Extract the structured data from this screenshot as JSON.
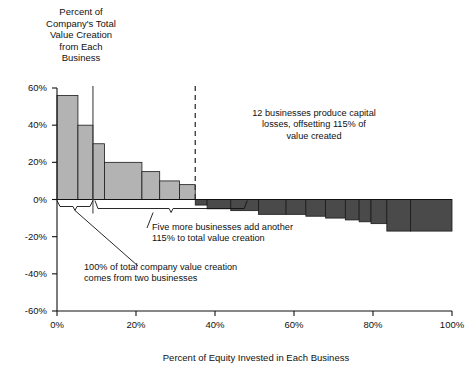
{
  "chart_data": {
    "type": "bar",
    "title": "",
    "ylabel": "Percent of\nCompany's Total\nValue Creation\nfrom Each\nBusiness",
    "xlabel": "Percent of Equity Invested in Each Business",
    "ylim": [
      -60,
      60
    ],
    "xlim": [
      0,
      100
    ],
    "grid": false,
    "legend": "none",
    "y_ticks": [
      "60%",
      "40%",
      "20%",
      "0%",
      "-20%",
      "-40%",
      "-60%"
    ],
    "y_tick_values": [
      60,
      40,
      20,
      0,
      -20,
      -40,
      -60
    ],
    "x_ticks": [
      "0%",
      "20%",
      "40%",
      "60%",
      "80%",
      "100%"
    ],
    "x_tick_values": [
      0,
      20,
      40,
      60,
      80,
      100
    ],
    "bar_fill_positive": "#b3b3b3",
    "bar_fill_negative": "#4a4a4a",
    "bars": [
      {
        "x0": 0.0,
        "x1": 5.3,
        "value": 56
      },
      {
        "x0": 5.3,
        "x1": 9.1,
        "value": 40
      },
      {
        "x0": 9.1,
        "x1": 12.0,
        "value": 30
      },
      {
        "x0": 12.0,
        "x1": 21.5,
        "value": 20
      },
      {
        "x0": 21.5,
        "x1": 26.0,
        "value": 15
      },
      {
        "x0": 26.0,
        "x1": 31.0,
        "value": 10
      },
      {
        "x0": 31.0,
        "x1": 35.0,
        "value": 8
      },
      {
        "x0": 35.0,
        "x1": 38.0,
        "value": -3
      },
      {
        "x0": 38.0,
        "x1": 44.0,
        "value": -5
      },
      {
        "x0": 44.0,
        "x1": 51.0,
        "value": -6
      },
      {
        "x0": 51.0,
        "x1": 58.0,
        "value": -8
      },
      {
        "x0": 58.0,
        "x1": 63.0,
        "value": -8
      },
      {
        "x0": 63.0,
        "x1": 68.0,
        "value": -9
      },
      {
        "x0": 68.0,
        "x1": 73.0,
        "value": -10
      },
      {
        "x0": 73.0,
        "x1": 76.5,
        "value": -11
      },
      {
        "x0": 76.5,
        "x1": 79.5,
        "value": -12
      },
      {
        "x0": 79.5,
        "x1": 83.5,
        "value": -13
      },
      {
        "x0": 83.5,
        "x1": 89.5,
        "value": -17
      },
      {
        "x0": 89.5,
        "x1": 100.0,
        "value": -17
      }
    ],
    "markers": {
      "solid_vline_x": 9.1,
      "dashed_vline_x": 35.0
    },
    "annotations": [
      {
        "id": "capital-losses",
        "text": "12 businesses produce capital\nlosses, offsetting 115% of\nvalue created",
        "x_pct": 62,
        "y_pct": 34
      },
      {
        "id": "five-more-businesses",
        "text": "Five more businesses add another\n115% to total value creation",
        "x_pct": 44,
        "y_pct": -14
      },
      {
        "id": "two-businesses",
        "text": "100% of total company value creation\ncomes from two businesses",
        "x_pct": 28,
        "y_pct": -37
      }
    ]
  }
}
